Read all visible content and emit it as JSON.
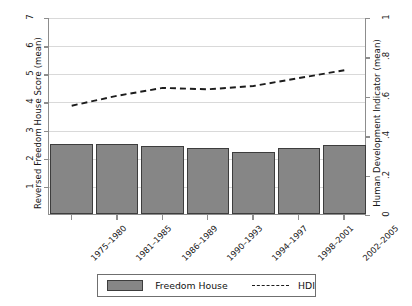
{
  "chart_data": {
    "type": "bar",
    "title": "",
    "xlabel": "",
    "ylabel": "Reversed Freedom House Score (mean)",
    "y2label": "Human Development Indicator (mean)",
    "categories": [
      "1975–1980",
      "1981–1985",
      "1986–1989",
      "1990–1993",
      "1994–1997",
      "1998–2001",
      "2002–2005"
    ],
    "ylim": [
      0,
      7
    ],
    "y2lim": [
      0,
      1
    ],
    "yticks": [
      "1",
      "2",
      "3",
      "4",
      "5",
      "6",
      "7"
    ],
    "ytick_values": [
      1,
      2,
      3,
      4,
      5,
      6,
      7
    ],
    "y2ticks": [
      "0",
      ".2",
      ".4",
      ".6",
      ".8",
      "1"
    ],
    "y2tick_values": [
      0,
      0.2,
      0.4,
      0.6,
      0.8,
      1
    ],
    "grid": true,
    "legend_position": "below",
    "series": [
      {
        "name": "Freedom House",
        "kind": "bar",
        "axis": "left",
        "color": "#868686",
        "values": [
          2.5,
          2.5,
          2.4,
          2.33,
          2.2,
          2.33,
          2.45
        ]
      },
      {
        "name": "HDI",
        "kind": "line",
        "style": "dashed",
        "axis": "right",
        "color": "#1c1c1c",
        "values": [
          0.555,
          0.605,
          0.645,
          0.638,
          0.655,
          0.695,
          0.735
        ]
      }
    ]
  },
  "legend": {
    "freedom_house_label": "Freedom House",
    "hdi_label": "HDI"
  },
  "colors": {
    "bar_fill": "#868686",
    "bar_edge": "#3d3d3d",
    "line": "#1c1c1c",
    "grid": "#d9d9d9",
    "axis": "#8d8d8d",
    "background": "#ffffff"
  }
}
